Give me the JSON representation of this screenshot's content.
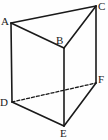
{
  "figure": {
    "type": "geometric-solid",
    "name": "triangular-prism",
    "canvas": {
      "width": 108,
      "height": 140
    },
    "background_color": "#fefefe",
    "stroke_color": "#1a1a1a",
    "label_color": "#1a1a1a",
    "vertices": [
      {
        "id": "A",
        "label": "A",
        "x": 11,
        "y": 23,
        "label_x": 1,
        "label_y": 16
      },
      {
        "id": "B",
        "label": "B",
        "x": 64,
        "y": 48,
        "label_x": 56,
        "label_y": 35
      },
      {
        "id": "C",
        "label": "C",
        "x": 96,
        "y": 6,
        "label_x": 98,
        "label_y": 1
      },
      {
        "id": "D",
        "label": "D",
        "x": 12,
        "y": 102,
        "label_x": 0,
        "label_y": 97
      },
      {
        "id": "E",
        "label": "E",
        "x": 64,
        "y": 126,
        "label_x": 60,
        "label_y": 128
      },
      {
        "id": "F",
        "label": "F",
        "x": 96,
        "y": 83,
        "label_x": 98,
        "label_y": 74
      }
    ],
    "edges": [
      {
        "id": "AC",
        "from": "A",
        "to": "C",
        "style": "solid",
        "width": 1.6
      },
      {
        "id": "AB",
        "from": "A",
        "to": "B",
        "style": "solid",
        "width": 1.6
      },
      {
        "id": "BC",
        "from": "B",
        "to": "C",
        "style": "solid",
        "width": 1.6
      },
      {
        "id": "AD",
        "from": "A",
        "to": "D",
        "style": "solid",
        "width": 1.6
      },
      {
        "id": "BE",
        "from": "B",
        "to": "E",
        "style": "solid",
        "width": 1.6
      },
      {
        "id": "CF",
        "from": "C",
        "to": "F",
        "style": "solid",
        "width": 1.6
      },
      {
        "id": "DE",
        "from": "D",
        "to": "E",
        "style": "solid",
        "width": 1.6
      },
      {
        "id": "EF",
        "from": "E",
        "to": "F",
        "style": "solid",
        "width": 1.6
      },
      {
        "id": "DF",
        "from": "D",
        "to": "F",
        "style": "dashed",
        "width": 1.3,
        "dash_pattern": "3,2"
      }
    ]
  }
}
